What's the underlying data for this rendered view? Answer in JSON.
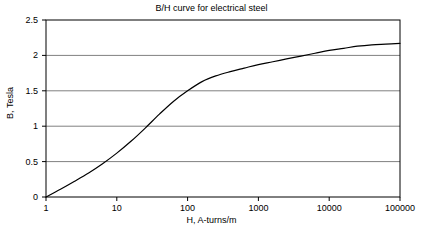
{
  "chart_data": {
    "type": "line",
    "title": "B/H curve for electrical steel",
    "xlabel": "H, A-turns/m",
    "ylabel": "B, Tesla",
    "xscale": "log",
    "yscale": "linear",
    "xlim": [
      1,
      100000
    ],
    "ylim": [
      0,
      2.5
    ],
    "xticks": [
      1,
      10,
      100,
      1000,
      10000,
      100000
    ],
    "xtick_labels": [
      "1",
      "10",
      "100",
      "1000",
      "10000",
      "100000"
    ],
    "yticks": [
      0,
      0.5,
      1,
      1.5,
      2,
      2.5
    ],
    "ytick_labels": [
      "0",
      "0.5",
      "1",
      "1.5",
      "2",
      "2.5"
    ],
    "grid": "horizontal",
    "grid_color": "#808080",
    "line_color": "#000000",
    "line_width": 1.2,
    "legend": null,
    "series": [
      {
        "name": "B/H curve",
        "x": [
          1,
          1.6,
          2.5,
          4,
          6.3,
          10,
          16,
          25,
          40,
          63,
          100,
          160,
          250,
          400,
          630,
          1000,
          1600,
          2500,
          4000,
          6300,
          10000,
          16000,
          25000,
          40000,
          63000,
          100000
        ],
        "y": [
          0.0,
          0.11,
          0.22,
          0.34,
          0.47,
          0.62,
          0.79,
          0.97,
          1.17,
          1.35,
          1.5,
          1.63,
          1.71,
          1.77,
          1.82,
          1.87,
          1.91,
          1.95,
          1.99,
          2.03,
          2.07,
          2.1,
          2.13,
          2.15,
          2.16,
          2.17
        ]
      }
    ]
  },
  "figure": {
    "background": "#ffffff",
    "plot_background": "#ffffff",
    "axis_color": "#000000"
  }
}
